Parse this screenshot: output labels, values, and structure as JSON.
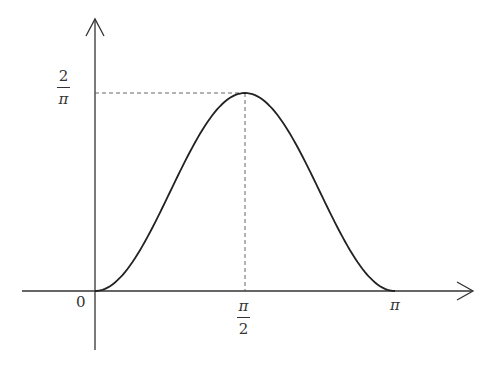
{
  "chart_data": {
    "type": "line",
    "title": "",
    "xlabel": "",
    "ylabel": "",
    "function": "(2/pi) * sin^2(x)",
    "x_ticks": [
      "0",
      "π/2",
      "π"
    ],
    "y_ticks": [
      "2/π"
    ],
    "xlim": [
      0,
      3.1416
    ],
    "ylim": [
      0,
      0.6366
    ],
    "peak": {
      "x": 1.5708,
      "y": 0.6366
    },
    "x": [
      0,
      0.3927,
      0.7854,
      1.1781,
      1.5708,
      1.9635,
      2.3562,
      2.7489,
      3.1416
    ],
    "values": [
      0,
      0.0932,
      0.3183,
      0.5434,
      0.6366,
      0.5434,
      0.3183,
      0.0932,
      0
    ],
    "annotations": [
      "dashed horizontal line at y=2/π to peak",
      "dashed vertical line from peak down to x=π/2"
    ],
    "grid": false,
    "legend": null
  },
  "labels": {
    "origin": "0",
    "x_mid_num": "π",
    "x_mid_den": "2",
    "x_end": "π",
    "y_peak_num": "2",
    "y_peak_den": "π"
  },
  "colors": {
    "curve": "#222222",
    "axis": "#333333",
    "dashed": "#555555"
  }
}
